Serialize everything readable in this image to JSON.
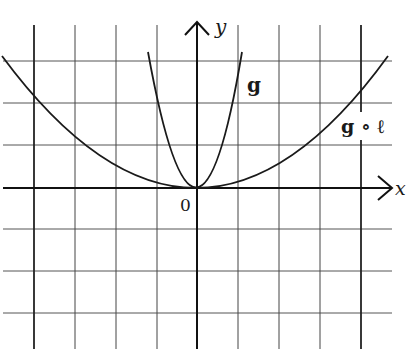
{
  "diagram": {
    "type": "function-graph",
    "axes": {
      "x_label": "x",
      "y_label": "y",
      "origin_label": "0"
    },
    "grid": {
      "x_min": -4,
      "x_max": 4,
      "y_min": -3,
      "y_max": 3,
      "step": 1
    },
    "curves": [
      {
        "id": "g",
        "label": "g",
        "equation": "y = 3x^2",
        "color": "#1a1a1a"
      },
      {
        "id": "g_compose_l",
        "label": "g ∘ ℓ",
        "equation": "y = x^2 / 8",
        "color": "#1a1a1a"
      }
    ]
  }
}
